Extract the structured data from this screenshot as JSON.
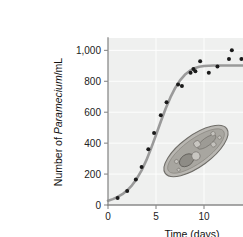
{
  "figure": {
    "background_color": "#ffffff",
    "plot_background_color": "#eff0ef",
    "grid_color": "#ffffff",
    "axis_color": "#8a8a8a",
    "curve_color": "#9a9a9a",
    "point_color": "#1a1a1a"
  },
  "labels": {
    "y_axis_prefix": "Number of ",
    "y_axis_italic": "Paramecium",
    "y_axis_suffix": "/mL",
    "x_axis_title": "Time (days)",
    "y_ticks": [
      "0",
      "200",
      "400",
      "600",
      "800",
      "1,000"
    ],
    "x_ticks": [
      "0",
      "5",
      "10",
      "15"
    ],
    "illustration_name": "paramecium-illustration"
  },
  "chart_data": {
    "type": "scatter",
    "title": "",
    "subtitle": "",
    "xlabel": "Time (days)",
    "ylabel": "Number of Paramecium/mL",
    "xlim": [
      0,
      17.5
    ],
    "ylim": [
      0,
      1080
    ],
    "xticks": [
      0,
      5,
      10,
      15
    ],
    "yticks": [
      0,
      200,
      400,
      600,
      800,
      1000
    ],
    "grid": true,
    "grid_axis": "both",
    "legend": "none",
    "annotations": [
      {
        "name": "paramecium-illustration",
        "description": "Shaded slipper-shaped drawing of a Paramecium cell with vacuoles, placed inside the plot area",
        "x": 10.3,
        "y": 370
      }
    ],
    "series": [
      {
        "name": "Observed Paramecium density",
        "type": "scatter",
        "marker": "circle",
        "color": "#1a1a1a",
        "points": [
          {
            "x": 1.0,
            "y": 45
          },
          {
            "x": 2.0,
            "y": 90
          },
          {
            "x": 2.9,
            "y": 165
          },
          {
            "x": 3.5,
            "y": 245
          },
          {
            "x": 4.2,
            "y": 360
          },
          {
            "x": 4.8,
            "y": 465
          },
          {
            "x": 5.5,
            "y": 580
          },
          {
            "x": 6.1,
            "y": 665
          },
          {
            "x": 7.3,
            "y": 780
          },
          {
            "x": 7.7,
            "y": 770
          },
          {
            "x": 8.6,
            "y": 855
          },
          {
            "x": 8.9,
            "y": 880
          },
          {
            "x": 9.1,
            "y": 865
          },
          {
            "x": 9.6,
            "y": 930
          },
          {
            "x": 10.5,
            "y": 855
          },
          {
            "x": 11.4,
            "y": 895
          },
          {
            "x": 12.9,
            "y": 1000
          },
          {
            "x": 12.6,
            "y": 945
          },
          {
            "x": 13.9,
            "y": 945
          },
          {
            "x": 14.4,
            "y": 820
          },
          {
            "x": 15.7,
            "y": 945
          }
        ]
      },
      {
        "name": "Logistic growth model",
        "type": "line",
        "color": "#9a9a9a",
        "carrying_capacity": 900,
        "inflection_day": 5.6,
        "growth_rate": 0.62,
        "points": [
          {
            "x": 0.0,
            "y": 28
          },
          {
            "x": 0.5,
            "y": 38
          },
          {
            "x": 1.0,
            "y": 52
          },
          {
            "x": 1.5,
            "y": 70
          },
          {
            "x": 2.0,
            "y": 95
          },
          {
            "x": 2.5,
            "y": 127
          },
          {
            "x": 3.0,
            "y": 170
          },
          {
            "x": 3.5,
            "y": 224
          },
          {
            "x": 4.0,
            "y": 290
          },
          {
            "x": 4.5,
            "y": 368
          },
          {
            "x": 5.0,
            "y": 453
          },
          {
            "x": 5.5,
            "y": 540
          },
          {
            "x": 6.0,
            "y": 622
          },
          {
            "x": 6.5,
            "y": 696
          },
          {
            "x": 7.0,
            "y": 757
          },
          {
            "x": 7.5,
            "y": 806
          },
          {
            "x": 8.0,
            "y": 842
          },
          {
            "x": 8.5,
            "y": 867
          },
          {
            "x": 9.0,
            "y": 884
          },
          {
            "x": 9.5,
            "y": 894
          },
          {
            "x": 10.0,
            "y": 899
          },
          {
            "x": 11.0,
            "y": 902
          },
          {
            "x": 12.0,
            "y": 902
          },
          {
            "x": 13.0,
            "y": 902
          },
          {
            "x": 14.0,
            "y": 902
          },
          {
            "x": 15.0,
            "y": 902
          },
          {
            "x": 16.0,
            "y": 902
          },
          {
            "x": 17.5,
            "y": 902
          }
        ]
      }
    ]
  }
}
